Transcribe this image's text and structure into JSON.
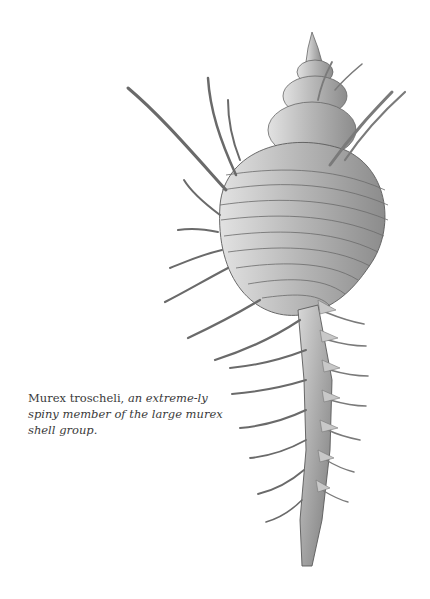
{
  "caption": {
    "species": "Murex troscheli,",
    "description": " an extreme-ly spiny member of the large murex shell group."
  },
  "illustration": {
    "subject": "murex-shell-drawing",
    "stroke_color": "#555555",
    "shade_color": "#8a8a8a"
  }
}
